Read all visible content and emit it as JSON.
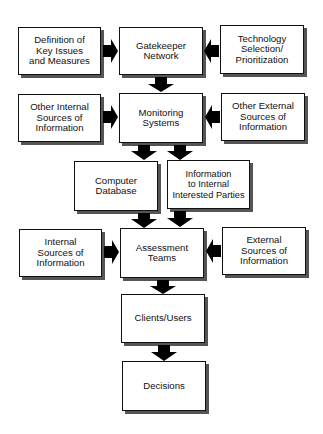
{
  "diagram": {
    "type": "flowchart",
    "nodes": [
      {
        "id": "definition",
        "label": "Definition of\nKey Issues\nand Measures"
      },
      {
        "id": "gatekeeper",
        "label": "Gatekeeper\nNetwork"
      },
      {
        "id": "technology",
        "label": "Technology\nSelection/\nPrioritization"
      },
      {
        "id": "other_internal",
        "label": "Other Internal\nSources of\nInformation"
      },
      {
        "id": "monitoring",
        "label": "Monitoring\nSystems"
      },
      {
        "id": "other_external",
        "label": "Other External\nSources of\nInformation"
      },
      {
        "id": "computer_db",
        "label": "Computer\nDatabase"
      },
      {
        "id": "info_internal",
        "label": "Information\nto Internal\nInterested Parties"
      },
      {
        "id": "internal_sources",
        "label": "Internal\nSources of\nInformation"
      },
      {
        "id": "assessment",
        "label": "Assessment\nTeams"
      },
      {
        "id": "external_sources",
        "label": "External\nSources of\nInformation"
      },
      {
        "id": "clients",
        "label": "Clients/Users"
      },
      {
        "id": "decisions",
        "label": "Decisions"
      }
    ],
    "edges": [
      {
        "from": "definition",
        "to": "gatekeeper"
      },
      {
        "from": "technology",
        "to": "gatekeeper"
      },
      {
        "from": "gatekeeper",
        "to": "monitoring"
      },
      {
        "from": "other_internal",
        "to": "monitoring"
      },
      {
        "from": "other_external",
        "to": "monitoring"
      },
      {
        "from": "monitoring",
        "to": "computer_db"
      },
      {
        "from": "monitoring",
        "to": "info_internal"
      },
      {
        "from": "computer_db",
        "to": "assessment"
      },
      {
        "from": "info_internal",
        "to": "assessment"
      },
      {
        "from": "internal_sources",
        "to": "assessment"
      },
      {
        "from": "external_sources",
        "to": "assessment"
      },
      {
        "from": "assessment",
        "to": "clients"
      },
      {
        "from": "clients",
        "to": "decisions"
      }
    ]
  }
}
